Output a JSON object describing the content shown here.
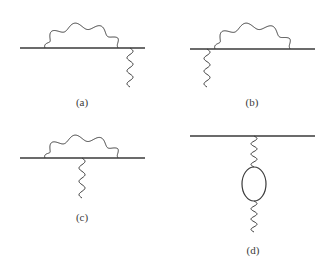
{
  "figure": {
    "stroke_color": "#3a3a3a",
    "background": "#ffffff",
    "panels": [
      {
        "id": "a",
        "label": "(a)",
        "label_pos": [
          82,
          96
        ],
        "fermion_line": {
          "x1": 20,
          "x2": 145,
          "y": 48
        },
        "photon_arc": {
          "x1": 45,
          "x2": 118,
          "y_base": 48,
          "peak": 23,
          "bumps": 5
        },
        "external_photon": {
          "x": 130,
          "y1": 48,
          "y2": 87,
          "waves": 3
        }
      },
      {
        "id": "b",
        "label": "(b)",
        "label_pos": [
          252,
          96
        ],
        "fermion_line": {
          "x1": 190,
          "x2": 315,
          "y": 49
        },
        "photon_arc": {
          "x1": 215,
          "x2": 290,
          "y_base": 49,
          "peak": 23,
          "bumps": 5
        },
        "external_photon": {
          "x": 207,
          "y1": 49,
          "y2": 87,
          "waves": 3
        }
      },
      {
        "id": "c",
        "label": "(c)",
        "label_pos": [
          82,
          211
        ],
        "fermion_line": {
          "x1": 20,
          "x2": 145,
          "y": 158
        },
        "photon_arc": {
          "x1": 45,
          "x2": 118,
          "y_base": 158,
          "peak": 135,
          "bumps": 5
        },
        "external_photon": {
          "x": 82,
          "y1": 158,
          "y2": 198,
          "waves": 3
        }
      },
      {
        "id": "d",
        "label": "(d)",
        "label_pos": [
          253,
          244
        ],
        "fermion_line": {
          "x1": 190,
          "x2": 315,
          "y": 136
        },
        "photon_top": {
          "x": 254,
          "y1": 136,
          "y2": 167,
          "waves": 3
        },
        "fermion_loop": {
          "cx": 254,
          "cy": 184,
          "rx": 12,
          "ry": 17
        },
        "photon_bottom": {
          "x": 254,
          "y1": 201,
          "y2": 232,
          "waves": 3
        }
      }
    ]
  }
}
